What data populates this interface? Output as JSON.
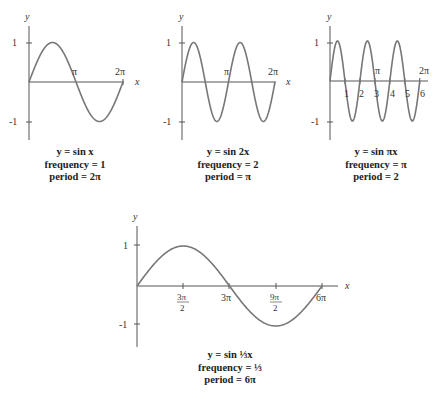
{
  "figure": {
    "panels": [
      {
        "id": "sinx",
        "equation": "y = sin x",
        "frequency": "frequency = 1",
        "period": "period = 2π",
        "y_label": "y",
        "x_label": "x",
        "y_ticks": [
          "1",
          "-1"
        ],
        "x_ticks": [
          "π",
          "2π"
        ]
      },
      {
        "id": "sin2x",
        "equation": "y = sin 2x",
        "frequency": "frequency = 2",
        "period": "period = π",
        "y_label": "y",
        "x_label": "x",
        "y_ticks": [
          "1",
          "-1"
        ],
        "x_ticks": [
          "π",
          "2π"
        ]
      },
      {
        "id": "sinpix",
        "equation": "y = sin πx",
        "frequency": "frequency = π",
        "period": "period = 2",
        "y_label": "y",
        "x_label": "x",
        "y_ticks": [
          "1",
          "-1"
        ],
        "x_ticks": [
          "π",
          "2π"
        ],
        "x_num_ticks": [
          "1",
          "2",
          "3",
          "4",
          "5",
          "6"
        ]
      },
      {
        "id": "sinx3",
        "equation": "y = sin ⅓x",
        "frequency": "frequency = ⅓",
        "period": "period = 6π",
        "y_label": "y",
        "x_label": "x",
        "y_ticks": [
          "1",
          "-1"
        ],
        "x_ticks": [
          "3π/2",
          "3π",
          "9π/2",
          "6π"
        ]
      }
    ]
  }
}
